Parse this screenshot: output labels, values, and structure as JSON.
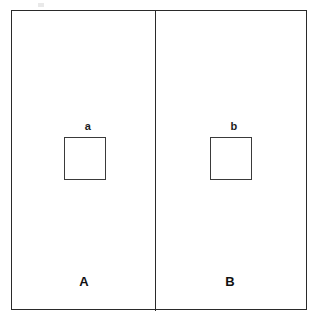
{
  "figure": {
    "width": 321,
    "height": 322,
    "background_color": "#ffffff",
    "line_color": "#2a2a2a",
    "text_color": "#111111"
  },
  "panels": [
    {
      "id": "panel-a",
      "label": "A",
      "inner_square_label": "a"
    },
    {
      "id": "panel-b",
      "label": "B",
      "inner_square_label": "b"
    }
  ],
  "labels": {
    "panel_left": "A",
    "panel_right": "B",
    "square_left": "a",
    "square_right": "b"
  }
}
